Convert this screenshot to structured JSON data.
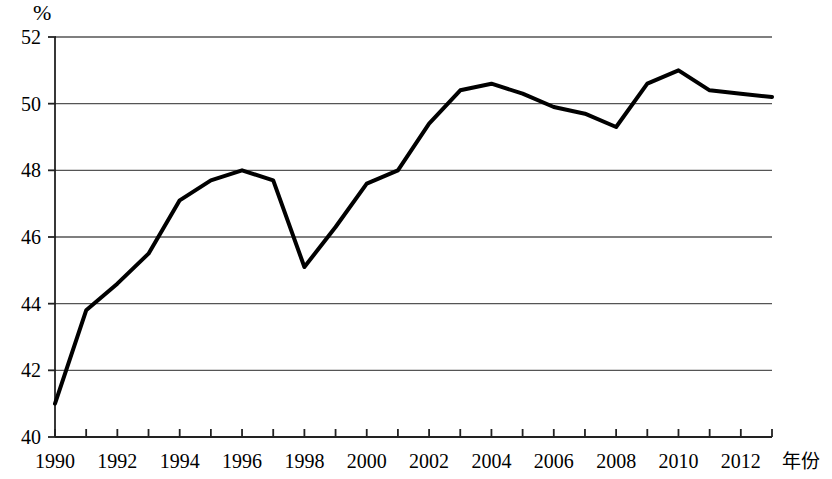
{
  "chart_data": {
    "type": "line",
    "title": "",
    "subtitle": "",
    "xlabel": "年份",
    "ylabel": "%",
    "y_unit_symbol": "%",
    "x": [
      1990,
      1991,
      1992,
      1993,
      1994,
      1995,
      1996,
      1997,
      1998,
      1999,
      2000,
      2001,
      2002,
      2003,
      2004,
      2005,
      2006,
      2007,
      2008,
      2009,
      2010,
      2011,
      2012,
      2013
    ],
    "values": [
      41.0,
      43.8,
      44.6,
      45.5,
      47.1,
      47.7,
      48.0,
      47.7,
      45.1,
      46.3,
      47.6,
      48.0,
      49.4,
      50.4,
      50.6,
      50.3,
      49.9,
      49.7,
      49.3,
      50.6,
      51.0,
      50.4,
      50.3,
      50.2
    ],
    "series": [
      {
        "name": "",
        "values": [
          41.0,
          43.8,
          44.6,
          45.5,
          47.1,
          47.7,
          48.0,
          47.7,
          45.1,
          46.3,
          47.6,
          48.0,
          49.4,
          50.4,
          50.6,
          50.3,
          49.9,
          49.7,
          49.3,
          50.6,
          51.0,
          50.4,
          50.3,
          50.2
        ],
        "color": "#000000"
      }
    ],
    "xlim": [
      1990,
      2013
    ],
    "ylim": [
      40,
      52
    ],
    "y_ticks": [
      40,
      42,
      44,
      46,
      48,
      50,
      52
    ],
    "y_tick_labels": [
      "40",
      "42",
      "44",
      "46",
      "48",
      "50",
      "52"
    ],
    "x_ticks": [
      1990,
      1991,
      1992,
      1993,
      1994,
      1995,
      1996,
      1997,
      1998,
      1999,
      2000,
      2001,
      2002,
      2003,
      2004,
      2005,
      2006,
      2007,
      2008,
      2009,
      2010,
      2011,
      2012,
      2013
    ],
    "x_tick_labels_shown": [
      "1990",
      "1992",
      "1994",
      "1996",
      "1998",
      "2000",
      "2002",
      "2004",
      "2006",
      "2008",
      "2010",
      "2012"
    ],
    "x_labeled_years": [
      1990,
      1992,
      1994,
      1996,
      1998,
      2000,
      2002,
      2004,
      2006,
      2008,
      2010,
      2012
    ],
    "grid": true,
    "grid_orientation": "horizontal",
    "grid_color": "#555555",
    "legend": false,
    "legend_position": "none",
    "line_color": "#000000",
    "line_width": 4,
    "markers": false,
    "annotations": []
  }
}
